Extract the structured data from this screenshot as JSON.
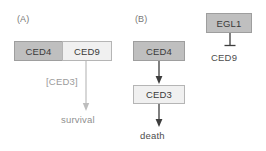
{
  "figure": {
    "type": "diagram",
    "panels": [
      {
        "id": "A",
        "label": "(A)",
        "nodes": [
          {
            "id": "ced4-a",
            "label": "CED4",
            "style": "filled-gray"
          },
          {
            "id": "ced9-a",
            "label": "CED9",
            "style": "light-gray"
          }
        ],
        "edge_label": "[CED3]",
        "outcome": "survival",
        "edge_kind": "arrow-down"
      },
      {
        "id": "B",
        "label": "(B)",
        "nodes": [
          {
            "id": "ced4-b",
            "label": "CED4",
            "style": "filled-gray"
          },
          {
            "id": "ced3-b",
            "label": "CED3",
            "style": "light-gray"
          }
        ],
        "outcome": "death",
        "edge_kind": "arrow-down"
      },
      {
        "id": "C",
        "nodes": [
          {
            "id": "egl1",
            "label": "EGL1",
            "style": "filled-gray"
          },
          {
            "id": "ced9-c",
            "label": "CED9",
            "style": "plain-text"
          }
        ],
        "edge_kind": "inhibition-tbar"
      }
    ],
    "colors": {
      "box_fill_dark": "#bfbfbf",
      "box_border_dark": "#9e9e9e",
      "box_fill_light": "#f0f0f0",
      "box_border_light": "#b5b5b5",
      "text": "#3a3a3a",
      "muted_text": "#9b9b9b",
      "arrow_dark": "#3d3d3d",
      "arrow_light": "#bdbdbd",
      "background": "#ffffff"
    }
  }
}
